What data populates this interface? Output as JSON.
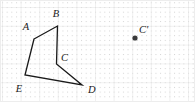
{
  "figure": {
    "width": 195,
    "height": 102,
    "background_color": "#ffffff"
  },
  "grid": {
    "major_line_color": "#e2e2e2",
    "minor_dot_color": "#d2d2d2",
    "major_spacing_x": 18.6,
    "major_spacing_y": 18.8,
    "minor_per_major": 4,
    "origin_x": 2.0,
    "origin_y": 7.0,
    "border_color": "#ededed",
    "border_visible": true
  },
  "polygon": {
    "name": "ABCDE",
    "stroke_color": "#1a1a1a",
    "stroke_width": 1.3,
    "fill": "none",
    "closed": true,
    "vertices": [
      {
        "label": "A",
        "x": 34,
        "y": 39,
        "label_x": 26,
        "label_y": 30
      },
      {
        "label": "B",
        "x": 57.5,
        "y": 26,
        "label_x": 56,
        "label_y": 17
      },
      {
        "label": "C",
        "x": 56.5,
        "y": 64,
        "label_x": 61,
        "label_y": 61
      },
      {
        "label": "D",
        "x": 82,
        "y": 85,
        "label_x": 88,
        "label_y": 93
      },
      {
        "label": "E",
        "x": 25,
        "y": 75,
        "label_x": 19,
        "label_y": 92
      }
    ]
  },
  "marked_points": [
    {
      "label": "C'",
      "x": 135,
      "y": 38,
      "radius": 2.6,
      "color": "#3a3a3a",
      "label_x": 139,
      "label_y": 33
    }
  ],
  "labels": {
    "font_size": 10.5,
    "font_style": "italic",
    "color": "#1a1a1a"
  }
}
